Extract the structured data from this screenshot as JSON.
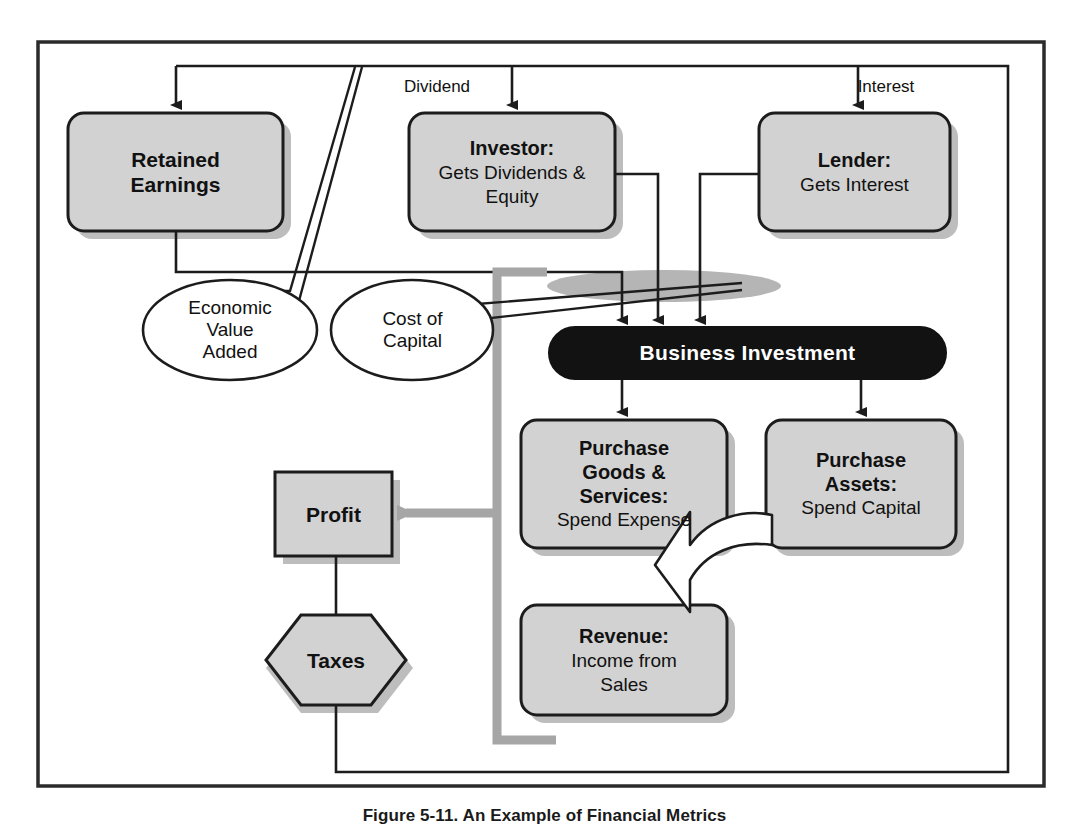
{
  "figure": {
    "caption": "Figure 5-11. An Example of Financial Metrics",
    "frame_border_color": "#2b2b2b",
    "box_fill": "#d2d2d2",
    "box_border": "#1c1c1c",
    "shadow_color": "#b9b9b9",
    "dark_fill": "#121212",
    "dark_text": "#ffffff",
    "gray_path_color": "#a6a6a6",
    "line_color": "#1c1c1c"
  },
  "edge_labels": [
    {
      "text": "Dividend",
      "x": 437,
      "y": 86
    },
    {
      "text": "Interest",
      "x": 886,
      "y": 86
    }
  ],
  "nodes": [
    {
      "id": "retained-earnings",
      "shape": "rounded-rect",
      "title": "Retained",
      "subtitle": "Earnings",
      "title_style": "bold",
      "subtitle_style": "bold",
      "x": 68,
      "y": 113,
      "w": 215,
      "h": 118
    },
    {
      "id": "investor",
      "shape": "rounded-rect",
      "title": "Investor:",
      "subtitle": "Gets Dividends &\nEquity",
      "title_style": "bold",
      "subtitle_style": "regular",
      "x": 409,
      "y": 113,
      "w": 206,
      "h": 118
    },
    {
      "id": "lender",
      "shape": "rounded-rect",
      "title": "Lender:",
      "subtitle": "Gets Interest",
      "title_style": "bold",
      "subtitle_style": "regular",
      "x": 759,
      "y": 113,
      "w": 191,
      "h": 118
    },
    {
      "id": "economic-value-added",
      "shape": "callout-ellipse",
      "title": "",
      "subtitle": "Economic\nValue\nAdded",
      "subtitle_style": "regular",
      "x": 143,
      "y": 280,
      "w": 174,
      "h": 100
    },
    {
      "id": "cost-of-capital",
      "shape": "callout-ellipse",
      "title": "",
      "subtitle": "Cost of\nCapital",
      "subtitle_style": "regular",
      "x": 331,
      "y": 280,
      "w": 163,
      "h": 100
    },
    {
      "id": "business-investment",
      "shape": "stadium-dark",
      "title": "Business Investment",
      "title_style": "bold",
      "x": 549,
      "y": 327,
      "w": 397,
      "h": 52
    },
    {
      "id": "purchase-goods-services",
      "shape": "rounded-rect",
      "title": "Purchase\nGoods &\nServices:",
      "subtitle": "Spend Expense",
      "title_style": "bold",
      "subtitle_style": "regular",
      "x": 521,
      "y": 420,
      "w": 206,
      "h": 128
    },
    {
      "id": "purchase-assets",
      "shape": "rounded-rect",
      "title": "Purchase\nAssets:",
      "subtitle": "Spend Capital",
      "title_style": "bold",
      "subtitle_style": "regular",
      "x": 766,
      "y": 420,
      "w": 190,
      "h": 128
    },
    {
      "id": "revenue",
      "shape": "rounded-rect",
      "title": "Revenue:",
      "subtitle": "Income from\nSales",
      "title_style": "bold",
      "subtitle_style": "regular",
      "x": 521,
      "y": 605,
      "w": 206,
      "h": 110
    },
    {
      "id": "profit",
      "shape": "rect",
      "title": "Profit",
      "title_style": "bold",
      "x": 275,
      "y": 472,
      "w": 117,
      "h": 84
    },
    {
      "id": "taxes",
      "shape": "hexagon",
      "title": "Taxes",
      "title_style": "bold",
      "x": 266,
      "y": 615,
      "w": 140,
      "h": 90
    }
  ],
  "connections": [
    {
      "from": "outer-loop-left",
      "to": "retained-earnings",
      "type": "arrow-down"
    },
    {
      "from": "top-bus",
      "to": "investor",
      "type": "arrow-down",
      "label": "Dividend"
    },
    {
      "from": "top-bus",
      "to": "lender",
      "type": "arrow-down",
      "label": "Interest"
    },
    {
      "from": "retained-earnings",
      "to": "business-investment",
      "type": "arrow-down"
    },
    {
      "from": "investor",
      "to": "business-investment",
      "type": "arrow-down"
    },
    {
      "from": "lender",
      "to": "business-investment",
      "type": "arrow-down"
    },
    {
      "from": "business-investment",
      "to": "purchase-goods-services",
      "type": "arrow-down"
    },
    {
      "from": "business-investment",
      "to": "purchase-assets",
      "type": "arrow-down"
    },
    {
      "from": "purchase-assets",
      "to": "revenue",
      "type": "block-arrow-curved"
    },
    {
      "from": "revenue",
      "to": "profit",
      "type": "gray-arrow-left"
    },
    {
      "from": "profit",
      "to": "taxes",
      "type": "line"
    },
    {
      "from": "taxes",
      "to": "outer-loop-bottom",
      "type": "line"
    },
    {
      "from": "economic-value-added",
      "to": "top-bus",
      "type": "callout-tail"
    },
    {
      "from": "cost-of-capital",
      "to": "business-investment",
      "type": "callout-tail"
    }
  ]
}
